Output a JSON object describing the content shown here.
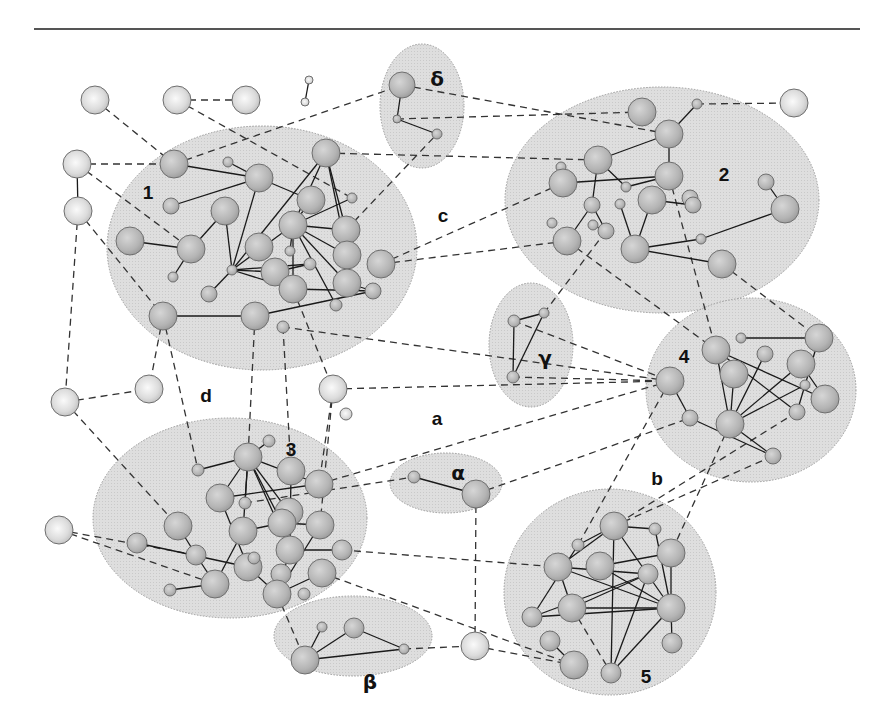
{
  "figure": {
    "width": 891,
    "height": 728,
    "colors": {
      "background": "#ffffff",
      "cluster_fill": "#dcdcdc",
      "node_fill": "#bdbdbd",
      "outer_node_fill": "#e4e4e4",
      "edge": "#1a1a1a"
    }
  },
  "clusters": [
    {
      "id": "c1",
      "label": "1",
      "cx": 262,
      "cy": 248,
      "rx": 155,
      "ry": 122,
      "lx": 148,
      "ly": 194,
      "kind": "num"
    },
    {
      "id": "c2",
      "label": "2",
      "cx": 662,
      "cy": 200,
      "rx": 157,
      "ry": 113,
      "lx": 724,
      "ly": 176,
      "kind": "num"
    },
    {
      "id": "c3",
      "label": "3",
      "cx": 230,
      "cy": 518,
      "rx": 137,
      "ry": 100,
      "lx": 291,
      "ly": 451,
      "kind": "num"
    },
    {
      "id": "c4",
      "label": "4",
      "cx": 751,
      "cy": 390,
      "rx": 105,
      "ry": 92,
      "lx": 684,
      "ly": 358,
      "kind": "num"
    },
    {
      "id": "c5",
      "label": "5",
      "cx": 610,
      "cy": 592,
      "rx": 106,
      "ry": 103,
      "lx": 646,
      "ly": 678,
      "kind": "num"
    },
    {
      "id": "alpha",
      "label": "α",
      "cx": 446,
      "cy": 483,
      "rx": 56,
      "ry": 30,
      "lx": 458,
      "ly": 474,
      "kind": "greek"
    },
    {
      "id": "beta",
      "label": "β",
      "cx": 353,
      "cy": 636,
      "rx": 79,
      "ry": 40,
      "lx": 370,
      "ly": 683,
      "kind": "greek"
    },
    {
      "id": "gamma",
      "label": "γ",
      "cx": 531,
      "cy": 345,
      "rx": 42,
      "ry": 62,
      "lx": 545,
      "ly": 359,
      "kind": "greek"
    },
    {
      "id": "delta",
      "label": "δ",
      "cx": 422,
      "cy": 106,
      "rx": 42,
      "ry": 62,
      "lx": 437,
      "ly": 80,
      "kind": "greek"
    }
  ],
  "region_labels": [
    {
      "label": "a",
      "x": 437,
      "y": 420
    },
    {
      "label": "b",
      "x": 657,
      "y": 480
    },
    {
      "label": "c",
      "x": 443,
      "y": 217
    },
    {
      "label": "d",
      "x": 206,
      "y": 397
    }
  ],
  "nodes": [
    {
      "id": "o1",
      "x": 95,
      "y": 100,
      "r": 14,
      "outer": true
    },
    {
      "id": "o2",
      "x": 177,
      "y": 100,
      "r": 14,
      "outer": true
    },
    {
      "id": "o3",
      "x": 246,
      "y": 100,
      "r": 14,
      "outer": true
    },
    {
      "id": "o4",
      "x": 309,
      "y": 80,
      "r": 4,
      "outer": true
    },
    {
      "id": "o5",
      "x": 305,
      "y": 102,
      "r": 4,
      "outer": true
    },
    {
      "id": "o6",
      "x": 77,
      "y": 164,
      "r": 14,
      "outer": true
    },
    {
      "id": "o7",
      "x": 78,
      "y": 211,
      "r": 14,
      "outer": true
    },
    {
      "id": "o8",
      "x": 794,
      "y": 103,
      "r": 14,
      "outer": true
    },
    {
      "id": "o9",
      "x": 65,
      "y": 402,
      "r": 14,
      "outer": true
    },
    {
      "id": "o10",
      "x": 149,
      "y": 389,
      "r": 14,
      "outer": true
    },
    {
      "id": "o11",
      "x": 333,
      "y": 389,
      "r": 14,
      "outer": true
    },
    {
      "id": "o12",
      "x": 346,
      "y": 414,
      "r": 6,
      "outer": true
    },
    {
      "id": "o13",
      "x": 59,
      "y": 530,
      "r": 14,
      "outer": true
    },
    {
      "id": "o14",
      "x": 475,
      "y": 646,
      "r": 14,
      "outer": true
    },
    {
      "id": "d1",
      "x": 402,
      "y": 85,
      "r": 13
    },
    {
      "id": "d2",
      "x": 397,
      "y": 119,
      "r": 4
    },
    {
      "id": "d3",
      "x": 437,
      "y": 134,
      "r": 5
    },
    {
      "id": "n1a",
      "x": 174,
      "y": 164,
      "r": 14
    },
    {
      "id": "n1b",
      "x": 228,
      "y": 162,
      "r": 5
    },
    {
      "id": "n1c",
      "x": 259,
      "y": 178,
      "r": 14
    },
    {
      "id": "n1d",
      "x": 326,
      "y": 153,
      "r": 14
    },
    {
      "id": "n1e",
      "x": 171,
      "y": 206,
      "r": 8
    },
    {
      "id": "n1f",
      "x": 225,
      "y": 211,
      "r": 14
    },
    {
      "id": "n1g",
      "x": 311,
      "y": 200,
      "r": 14
    },
    {
      "id": "n1h",
      "x": 352,
      "y": 198,
      "r": 5
    },
    {
      "id": "n1i",
      "x": 130,
      "y": 241,
      "r": 14
    },
    {
      "id": "n1j",
      "x": 191,
      "y": 249,
      "r": 14
    },
    {
      "id": "n1k",
      "x": 293,
      "y": 225,
      "r": 14
    },
    {
      "id": "n1l",
      "x": 346,
      "y": 230,
      "r": 14
    },
    {
      "id": "n1m",
      "x": 259,
      "y": 247,
      "r": 14
    },
    {
      "id": "n1n",
      "x": 290,
      "y": 251,
      "r": 5
    },
    {
      "id": "n1o",
      "x": 173,
      "y": 277,
      "r": 5
    },
    {
      "id": "n1p",
      "x": 232,
      "y": 270,
      "r": 5
    },
    {
      "id": "n1q",
      "x": 275,
      "y": 272,
      "r": 14
    },
    {
      "id": "n1r",
      "x": 310,
      "y": 264,
      "r": 6
    },
    {
      "id": "n1s",
      "x": 347,
      "y": 255,
      "r": 14
    },
    {
      "id": "n1t",
      "x": 381,
      "y": 264,
      "r": 14
    },
    {
      "id": "n1u",
      "x": 209,
      "y": 294,
      "r": 8
    },
    {
      "id": "n1v",
      "x": 293,
      "y": 289,
      "r": 14
    },
    {
      "id": "n1w",
      "x": 347,
      "y": 283,
      "r": 14
    },
    {
      "id": "n1x",
      "x": 373,
      "y": 291,
      "r": 8
    },
    {
      "id": "n1y",
      "x": 336,
      "y": 305,
      "r": 6
    },
    {
      "id": "n1z",
      "x": 163,
      "y": 316,
      "r": 14
    },
    {
      "id": "n1aa",
      "x": 255,
      "y": 316,
      "r": 14
    },
    {
      "id": "n1ab",
      "x": 283,
      "y": 327,
      "r": 6
    },
    {
      "id": "n2a",
      "x": 642,
      "y": 112,
      "r": 14
    },
    {
      "id": "n2b",
      "x": 697,
      "y": 104,
      "r": 5
    },
    {
      "id": "n2c",
      "x": 669,
      "y": 134,
      "r": 14
    },
    {
      "id": "n2d",
      "x": 598,
      "y": 160,
      "r": 14
    },
    {
      "id": "n2e",
      "x": 669,
      "y": 176,
      "r": 14
    },
    {
      "id": "n2f",
      "x": 561,
      "y": 167,
      "r": 5
    },
    {
      "id": "n2g",
      "x": 563,
      "y": 183,
      "r": 14
    },
    {
      "id": "n2h",
      "x": 626,
      "y": 187,
      "r": 5
    },
    {
      "id": "n2i",
      "x": 766,
      "y": 182,
      "r": 8
    },
    {
      "id": "n2j",
      "x": 592,
      "y": 205,
      "r": 8
    },
    {
      "id": "n2k",
      "x": 620,
      "y": 204,
      "r": 5
    },
    {
      "id": "n2l",
      "x": 652,
      "y": 200,
      "r": 14
    },
    {
      "id": "n2m",
      "x": 690,
      "y": 198,
      "r": 8
    },
    {
      "id": "n2n",
      "x": 693,
      "y": 205,
      "r": 8
    },
    {
      "id": "n2o",
      "x": 785,
      "y": 209,
      "r": 14
    },
    {
      "id": "n2p",
      "x": 552,
      "y": 223,
      "r": 5
    },
    {
      "id": "n2q",
      "x": 593,
      "y": 225,
      "r": 5
    },
    {
      "id": "n2r",
      "x": 606,
      "y": 231,
      "r": 8
    },
    {
      "id": "n2s",
      "x": 567,
      "y": 241,
      "r": 14
    },
    {
      "id": "n2t",
      "x": 701,
      "y": 239,
      "r": 5
    },
    {
      "id": "n2u",
      "x": 635,
      "y": 249,
      "r": 14
    },
    {
      "id": "n2v",
      "x": 722,
      "y": 264,
      "r": 14
    },
    {
      "id": "g1",
      "x": 514,
      "y": 321,
      "r": 6
    },
    {
      "id": "g2",
      "x": 544,
      "y": 313,
      "r": 5
    },
    {
      "id": "g3",
      "x": 513,
      "y": 377,
      "r": 6
    },
    {
      "id": "n4a",
      "x": 716,
      "y": 350,
      "r": 14
    },
    {
      "id": "n4b",
      "x": 741,
      "y": 338,
      "r": 5
    },
    {
      "id": "n4c",
      "x": 765,
      "y": 354,
      "r": 8
    },
    {
      "id": "n4d",
      "x": 819,
      "y": 338,
      "r": 14
    },
    {
      "id": "n4e",
      "x": 670,
      "y": 381,
      "r": 14
    },
    {
      "id": "n4f",
      "x": 734,
      "y": 374,
      "r": 14
    },
    {
      "id": "n4g",
      "x": 801,
      "y": 364,
      "r": 14
    },
    {
      "id": "n4h",
      "x": 805,
      "y": 385,
      "r": 5
    },
    {
      "id": "n4i",
      "x": 825,
      "y": 399,
      "r": 14
    },
    {
      "id": "n4j",
      "x": 690,
      "y": 418,
      "r": 8
    },
    {
      "id": "n4k",
      "x": 730,
      "y": 424,
      "r": 14
    },
    {
      "id": "n4l",
      "x": 797,
      "y": 412,
      "r": 8
    },
    {
      "id": "n4m",
      "x": 773,
      "y": 456,
      "r": 8
    },
    {
      "id": "al1",
      "x": 414,
      "y": 477,
      "r": 6
    },
    {
      "id": "al2",
      "x": 476,
      "y": 494,
      "r": 14
    },
    {
      "id": "n3a",
      "x": 269,
      "y": 441,
      "r": 6
    },
    {
      "id": "n3b",
      "x": 248,
      "y": 457,
      "r": 14
    },
    {
      "id": "n3c",
      "x": 198,
      "y": 470,
      "r": 6
    },
    {
      "id": "n3d",
      "x": 291,
      "y": 471,
      "r": 14
    },
    {
      "id": "n3e",
      "x": 319,
      "y": 484,
      "r": 14
    },
    {
      "id": "n3f",
      "x": 220,
      "y": 498,
      "r": 14
    },
    {
      "id": "n3g",
      "x": 245,
      "y": 503,
      "r": 6
    },
    {
      "id": "n3h",
      "x": 289,
      "y": 512,
      "r": 14
    },
    {
      "id": "n3i",
      "x": 178,
      "y": 526,
      "r": 14
    },
    {
      "id": "n3j",
      "x": 243,
      "y": 531,
      "r": 14
    },
    {
      "id": "n3k",
      "x": 282,
      "y": 523,
      "r": 14
    },
    {
      "id": "n3l",
      "x": 320,
      "y": 525,
      "r": 14
    },
    {
      "id": "n3m",
      "x": 137,
      "y": 543,
      "r": 10
    },
    {
      "id": "n3n",
      "x": 196,
      "y": 555,
      "r": 10
    },
    {
      "id": "n3o",
      "x": 290,
      "y": 550,
      "r": 14
    },
    {
      "id": "n3p",
      "x": 342,
      "y": 550,
      "r": 10
    },
    {
      "id": "n3q",
      "x": 248,
      "y": 567,
      "r": 14
    },
    {
      "id": "n3r",
      "x": 254,
      "y": 558,
      "r": 6
    },
    {
      "id": "n3s",
      "x": 281,
      "y": 574,
      "r": 10
    },
    {
      "id": "n3t",
      "x": 322,
      "y": 573,
      "r": 14
    },
    {
      "id": "n3u",
      "x": 170,
      "y": 590,
      "r": 6
    },
    {
      "id": "n3v",
      "x": 215,
      "y": 584,
      "r": 14
    },
    {
      "id": "n3w",
      "x": 277,
      "y": 594,
      "r": 14
    },
    {
      "id": "n3x",
      "x": 304,
      "y": 594,
      "r": 6
    },
    {
      "id": "b1",
      "x": 322,
      "y": 627,
      "r": 5
    },
    {
      "id": "b2",
      "x": 354,
      "y": 628,
      "r": 10
    },
    {
      "id": "b3",
      "x": 404,
      "y": 649,
      "r": 5
    },
    {
      "id": "b4",
      "x": 305,
      "y": 660,
      "r": 14
    },
    {
      "id": "n5a",
      "x": 614,
      "y": 526,
      "r": 14
    },
    {
      "id": "n5b",
      "x": 655,
      "y": 529,
      "r": 6
    },
    {
      "id": "n5c",
      "x": 578,
      "y": 545,
      "r": 6
    },
    {
      "id": "n5d",
      "x": 671,
      "y": 553,
      "r": 14
    },
    {
      "id": "n5e",
      "x": 558,
      "y": 567,
      "r": 14
    },
    {
      "id": "n5f",
      "x": 600,
      "y": 566,
      "r": 14
    },
    {
      "id": "n5g",
      "x": 648,
      "y": 574,
      "r": 10
    },
    {
      "id": "n5h",
      "x": 572,
      "y": 608,
      "r": 14
    },
    {
      "id": "n5i",
      "x": 671,
      "y": 608,
      "r": 14
    },
    {
      "id": "n5j",
      "x": 532,
      "y": 617,
      "r": 10
    },
    {
      "id": "n5k",
      "x": 550,
      "y": 641,
      "r": 10
    },
    {
      "id": "n5l",
      "x": 672,
      "y": 643,
      "r": 10
    },
    {
      "id": "n5m",
      "x": 574,
      "y": 665,
      "r": 14
    },
    {
      "id": "n5n",
      "x": 611,
      "y": 673,
      "r": 10
    }
  ],
  "edges_solid": [
    [
      "o4",
      "o5"
    ],
    [
      "o6",
      "o7"
    ],
    [
      "d1",
      "d2"
    ],
    [
      "d2",
      "d3"
    ],
    [
      "n1a",
      "n1c"
    ],
    [
      "n1b",
      "n1c"
    ],
    [
      "n1e",
      "n1c"
    ],
    [
      "n1c",
      "n1g"
    ],
    [
      "n1c",
      "n1p"
    ],
    [
      "n1i",
      "n1j"
    ],
    [
      "n1j",
      "n1f"
    ],
    [
      "n1j",
      "n1o"
    ],
    [
      "n1f",
      "n1p"
    ],
    [
      "n1d",
      "n1p"
    ],
    [
      "n1d",
      "n1k"
    ],
    [
      "n1d",
      "n1l"
    ],
    [
      "n1d",
      "n1s"
    ],
    [
      "n1k",
      "n1g"
    ],
    [
      "n1k",
      "n1h"
    ],
    [
      "n1k",
      "n1n"
    ],
    [
      "n1k",
      "n1l"
    ],
    [
      "n1k",
      "n1s"
    ],
    [
      "n1k",
      "n1w"
    ],
    [
      "n1k",
      "n1v"
    ],
    [
      "n1k",
      "n1y"
    ],
    [
      "n1p",
      "n1k"
    ],
    [
      "n1p",
      "n1u"
    ],
    [
      "n1p",
      "n1r"
    ],
    [
      "n1p",
      "n1v"
    ],
    [
      "n1p",
      "n1q"
    ],
    [
      "n1q",
      "n1r"
    ],
    [
      "n1v",
      "n1x"
    ],
    [
      "n1w",
      "n1x"
    ],
    [
      "n1z",
      "n1aa"
    ],
    [
      "n1aa",
      "n1x"
    ],
    [
      "n2b",
      "n2c"
    ],
    [
      "n2d",
      "n2c"
    ],
    [
      "n2c",
      "n2e"
    ],
    [
      "n2d",
      "n2j"
    ],
    [
      "n2d",
      "n2h"
    ],
    [
      "n2h",
      "n2e"
    ],
    [
      "n2g",
      "n2e"
    ],
    [
      "n2j",
      "n2s"
    ],
    [
      "n2j",
      "n2r"
    ],
    [
      "n2q",
      "n2r"
    ],
    [
      "n2k",
      "n2u"
    ],
    [
      "n2l",
      "n2u"
    ],
    [
      "n2l",
      "n2n"
    ],
    [
      "n2u",
      "n2t"
    ],
    [
      "n2t",
      "n2o"
    ],
    [
      "n2i",
      "n2o"
    ],
    [
      "n2u",
      "n2v"
    ],
    [
      "g1",
      "g2"
    ],
    [
      "g1",
      "g3"
    ],
    [
      "g2",
      "g3"
    ],
    [
      "n4b",
      "n4d"
    ],
    [
      "n4e",
      "n4j"
    ],
    [
      "n4j",
      "n4m"
    ],
    [
      "n4a",
      "n4k"
    ],
    [
      "n4a",
      "n4l"
    ],
    [
      "n4a",
      "n4i"
    ],
    [
      "n4f",
      "n4k"
    ],
    [
      "n4c",
      "n4k"
    ],
    [
      "n4g",
      "n4k"
    ],
    [
      "n4h",
      "n4k"
    ],
    [
      "n4d",
      "n4l"
    ],
    [
      "n4k",
      "n4m"
    ],
    [
      "n4g",
      "n4i"
    ],
    [
      "al1",
      "al2"
    ],
    [
      "n3a",
      "n3b"
    ],
    [
      "n3c",
      "n3b"
    ],
    [
      "n3b",
      "n3e"
    ],
    [
      "n3b",
      "n3f"
    ],
    [
      "n3b",
      "n3g"
    ],
    [
      "n3b",
      "n3h"
    ],
    [
      "n3b",
      "n3j"
    ],
    [
      "n3b",
      "n3k"
    ],
    [
      "n3b",
      "n3o"
    ],
    [
      "n3f",
      "n3e"
    ],
    [
      "n3f",
      "n3q"
    ],
    [
      "n3j",
      "n3k"
    ],
    [
      "n3k",
      "n3l"
    ],
    [
      "n3d",
      "n3o"
    ],
    [
      "n3o",
      "n3p"
    ],
    [
      "n3i",
      "n3n"
    ],
    [
      "n3m",
      "n3q"
    ],
    [
      "n3n",
      "n3v"
    ],
    [
      "n3u",
      "n3v"
    ],
    [
      "n3v",
      "n3j"
    ],
    [
      "n3o",
      "n3w"
    ],
    [
      "n3l",
      "n3w"
    ],
    [
      "n3q",
      "n3w"
    ],
    [
      "n3w",
      "n3t"
    ],
    [
      "b1",
      "b4"
    ],
    [
      "b4",
      "b2"
    ],
    [
      "b2",
      "b3"
    ],
    [
      "b4",
      "b3"
    ],
    [
      "n5a",
      "n5b"
    ],
    [
      "n5a",
      "n5e"
    ],
    [
      "n5a",
      "n5n"
    ],
    [
      "n5a",
      "n5i"
    ],
    [
      "n5b",
      "n5i"
    ],
    [
      "n5c",
      "n5a"
    ],
    [
      "n5c",
      "n5j"
    ],
    [
      "n5e",
      "n5i"
    ],
    [
      "n5e",
      "n5g"
    ],
    [
      "n5e",
      "n5h"
    ],
    [
      "n5f",
      "n5d"
    ],
    [
      "n5f",
      "n5i"
    ],
    [
      "n5d",
      "n5i"
    ],
    [
      "n5h",
      "n5g"
    ],
    [
      "n5h",
      "n5i"
    ],
    [
      "n5j",
      "n5i"
    ],
    [
      "n5j",
      "n5g"
    ],
    [
      "n5g",
      "n5n"
    ],
    [
      "n5i",
      "n5n"
    ],
    [
      "n5i",
      "n5l"
    ],
    [
      "n5k",
      "n5m"
    ]
  ],
  "edges_dashed": [
    [
      "o1",
      "n1a"
    ],
    [
      "o2",
      "o3"
    ],
    [
      "o2",
      "n1h"
    ],
    [
      "o6",
      "n1a"
    ],
    [
      "o6",
      "n1j"
    ],
    [
      "o7",
      "n1z"
    ],
    [
      "o7",
      "o9"
    ],
    [
      "n1a",
      "d1"
    ],
    [
      "n1d",
      "n2d"
    ],
    [
      "n1l",
      "d3"
    ],
    [
      "n1t",
      "n2g"
    ],
    [
      "n1t",
      "n2s"
    ],
    [
      "d1",
      "n2c"
    ],
    [
      "d2",
      "n2a"
    ],
    [
      "n2b",
      "o8"
    ],
    [
      "n1z",
      "o10"
    ],
    [
      "o9",
      "o10"
    ],
    [
      "o9",
      "n3i"
    ],
    [
      "n1z",
      "n3c"
    ],
    [
      "n1aa",
      "n3b"
    ],
    [
      "n1ab",
      "n3d"
    ],
    [
      "n1v",
      "o11"
    ],
    [
      "n1ab",
      "n4e"
    ],
    [
      "o11",
      "n3e"
    ],
    [
      "o11",
      "n3l"
    ],
    [
      "o11",
      "n4e"
    ],
    [
      "g3",
      "n4e"
    ],
    [
      "g1",
      "n4e"
    ],
    [
      "n2r",
      "g2"
    ],
    [
      "n2e",
      "n4a"
    ],
    [
      "n2s",
      "n4a"
    ],
    [
      "n2v",
      "n4d"
    ],
    [
      "n3e",
      "n4e"
    ],
    [
      "al2",
      "n4j"
    ],
    [
      "n3g",
      "al1"
    ],
    [
      "n4e",
      "n5c"
    ],
    [
      "n4k",
      "n5d"
    ],
    [
      "n4l",
      "n5a"
    ],
    [
      "n4m",
      "n5a"
    ],
    [
      "o13",
      "n3n"
    ],
    [
      "o13",
      "n3v"
    ],
    [
      "n3p",
      "n5e"
    ],
    [
      "n3t",
      "n5m"
    ],
    [
      "al2",
      "o14"
    ],
    [
      "o14",
      "n5m"
    ],
    [
      "b3",
      "o14"
    ],
    [
      "n3w",
      "b4"
    ],
    [
      "n5h",
      "n5n"
    ]
  ]
}
